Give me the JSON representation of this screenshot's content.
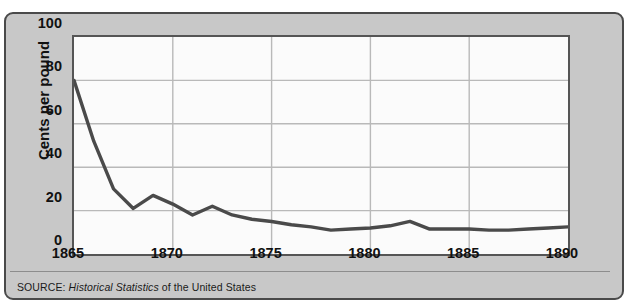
{
  "figure": {
    "source_prefix": "SOURCE:",
    "source_italic": "Historical Statistics",
    "source_suffix": "of the United States"
  },
  "colors": {
    "panel_background": "#c8c8c8",
    "panel_border": "#4a4a4a",
    "plot_background": "#fbfbfb",
    "plot_border": "#555555",
    "gridline": "#b9b9b9",
    "series_line": "#4a4a4a",
    "text": "#111111"
  },
  "chart_data": {
    "type": "line",
    "title": "",
    "xlabel": "",
    "ylabel": "Cents per pound",
    "xlim": [
      1865,
      1890
    ],
    "ylim": [
      0,
      100
    ],
    "grid": true,
    "legend": "none",
    "ytick_labels": [
      "0",
      "20",
      "40",
      "60",
      "80",
      "100"
    ],
    "ytick_values": [
      0,
      20,
      40,
      60,
      80,
      100
    ],
    "xtick_labels": [
      "1865",
      "1870",
      "1875",
      "1880",
      "1885",
      "1890"
    ],
    "xtick_values": [
      1865,
      1870,
      1875,
      1880,
      1885,
      1890
    ],
    "series": [
      {
        "name": "Cotton price",
        "color": "#4a4a4a",
        "x": [
          1865,
          1866,
          1867,
          1868,
          1869,
          1870,
          1871,
          1872,
          1873,
          1874,
          1875,
          1876,
          1877,
          1878,
          1879,
          1880,
          1881,
          1882,
          1883,
          1884,
          1885,
          1886,
          1887,
          1888,
          1889,
          1890
        ],
        "values": [
          80,
          52,
          30,
          21,
          27,
          23,
          18,
          22,
          18,
          16,
          15,
          13.5,
          12.5,
          11,
          11.5,
          12,
          13,
          15,
          11.5,
          11.5,
          11.5,
          11,
          11,
          11.5,
          12,
          12.5
        ]
      }
    ]
  }
}
